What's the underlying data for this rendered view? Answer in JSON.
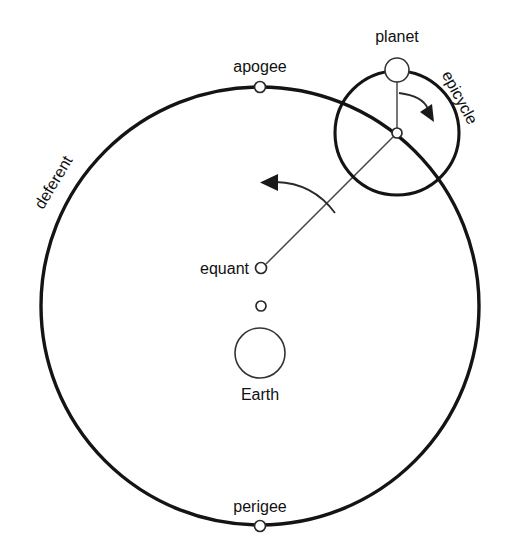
{
  "diagram": {
    "background_color": "#ffffff",
    "stroke_color": "#141414",
    "text_color": "#111111",
    "width": 509,
    "height": 555,
    "labels": {
      "planet": "planet",
      "epicycle": "epicycle",
      "apogee": "apogee",
      "deferent": "deferent",
      "equant": "equant",
      "earth": "Earth",
      "perigee": "perigee"
    },
    "geometry": {
      "deferent": {
        "cx": 260,
        "cy": 306,
        "r": 219
      },
      "epicycle": {
        "cx": 397,
        "cy": 133,
        "r": 62
      },
      "planet": {
        "cx": 397,
        "cy": 70,
        "r": 12
      },
      "epicycle_center_marker": {
        "cx": 397,
        "cy": 133,
        "r": 5
      },
      "apogee_marker": {
        "cx": 260,
        "cy": 87,
        "r": 5.5
      },
      "perigee_marker": {
        "cx": 260,
        "cy": 526,
        "r": 5.5
      },
      "equant_marker": {
        "cx": 261,
        "cy": 268,
        "r": 5.5
      },
      "deferent_center_marker": {
        "cx": 261,
        "cy": 306,
        "r": 5
      },
      "earth": {
        "cx": 260,
        "cy": 353,
        "r": 25
      },
      "equant_to_epicycle_line": {
        "x1": 266,
        "y1": 264,
        "x2": 393,
        "y2": 137
      },
      "epicycle_radius_line": {
        "x1": 397,
        "y1": 130,
        "x2": 397,
        "y2": 82
      }
    },
    "label_positions": {
      "planet": {
        "x": 397,
        "y": 42,
        "rotation": 0,
        "anchor": "middle"
      },
      "epicycle": {
        "x": 455,
        "y": 100,
        "rotation": 62,
        "anchor": "middle"
      },
      "apogee": {
        "x": 260,
        "y": 72,
        "rotation": 0,
        "anchor": "middle"
      },
      "deferent": {
        "x": 58,
        "y": 185,
        "rotation": -59,
        "anchor": "middle"
      },
      "equant": {
        "x": 248,
        "y": 274,
        "rotation": 0,
        "anchor": "end"
      },
      "earth": {
        "x": 260,
        "y": 400,
        "rotation": 0,
        "anchor": "middle"
      },
      "perigee": {
        "x": 260,
        "y": 512,
        "rotation": 0,
        "anchor": "middle"
      }
    },
    "motion_arrows": {
      "deferent_arrow": {
        "name": "deferent-motion-arrow",
        "direction": "counterclockwise",
        "path": "M 335 213 Q 315 184 273 183"
      },
      "epicycle_arrow": {
        "name": "epicycle-motion-arrow",
        "direction": "clockwise",
        "path": "M 399 92 Q 425 95 429 110"
      }
    }
  }
}
